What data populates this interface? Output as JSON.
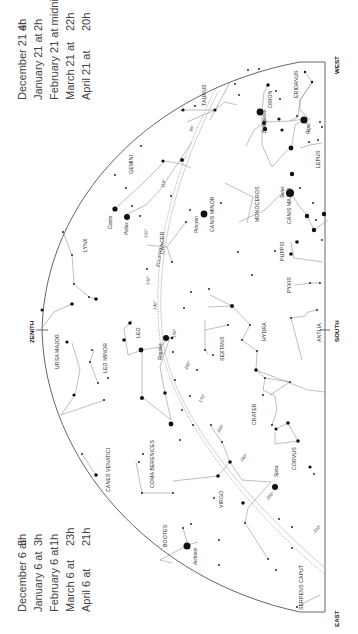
{
  "times_top": {
    "lines": [
      {
        "date": "December 21 at",
        "time": "4h"
      },
      {
        "date": "January 21 at",
        "time": "2h"
      },
      {
        "date": "February 21 at midnight",
        "time": ""
      },
      {
        "date": "March 21 at",
        "time": "22h"
      },
      {
        "date": "April 21 at",
        "time": "20h"
      }
    ]
  },
  "times_bottom": {
    "lines": [
      {
        "date": "December 6 at",
        "time": "5h"
      },
      {
        "date": "January 6 at",
        "time": "3h"
      },
      {
        "date": "February 6 at",
        "time": "1h"
      },
      {
        "date": "March 6 at",
        "time": "23h"
      },
      {
        "date": "April 6 at",
        "time": "21h"
      }
    ]
  },
  "directions": {
    "west": "WEST",
    "east": "EAST",
    "south": "SOUTH",
    "zenith": "ZENITH"
  },
  "ecliptic": {
    "label": "ECLIPTIC",
    "ticks": [
      "90°",
      "100°",
      "110°",
      "120°",
      "130°",
      "140°",
      "150°",
      "160°",
      "170°",
      "180°",
      "190°",
      "200°",
      "210°"
    ]
  },
  "constellations": [
    {
      "name": "TAURUS"
    },
    {
      "name": "ORION"
    },
    {
      "name": "ERIDANUS"
    },
    {
      "name": "LEPUS"
    },
    {
      "name": "GEMINI"
    },
    {
      "name": "CANIS MINOR"
    },
    {
      "name": "MONOCEROS"
    },
    {
      "name": "CANIS MAJOR"
    },
    {
      "name": "PUPPIS"
    },
    {
      "name": "PYXIS"
    },
    {
      "name": "CANCER"
    },
    {
      "name": "LYNX"
    },
    {
      "name": "LEO"
    },
    {
      "name": "LEO MINOR"
    },
    {
      "name": "URSA MAJOR"
    },
    {
      "name": "SEXTANS"
    },
    {
      "name": "HYDRA"
    },
    {
      "name": "ANTLIA"
    },
    {
      "name": "CRATER"
    },
    {
      "name": "CORVUS"
    },
    {
      "name": "VIRGO"
    },
    {
      "name": "COMA BERENICES"
    },
    {
      "name": "CANES VENATICI"
    },
    {
      "name": "BOOTES"
    },
    {
      "name": "SERPENS CAPUT"
    }
  ],
  "stars": [
    {
      "name": "Betelgeuse"
    },
    {
      "name": "Rigel"
    },
    {
      "name": "Sirius"
    },
    {
      "name": "Procyon"
    },
    {
      "name": "Castor"
    },
    {
      "name": "Pollux"
    },
    {
      "name": "Regulus"
    },
    {
      "name": "Spica"
    },
    {
      "name": "Arcturus"
    }
  ]
}
